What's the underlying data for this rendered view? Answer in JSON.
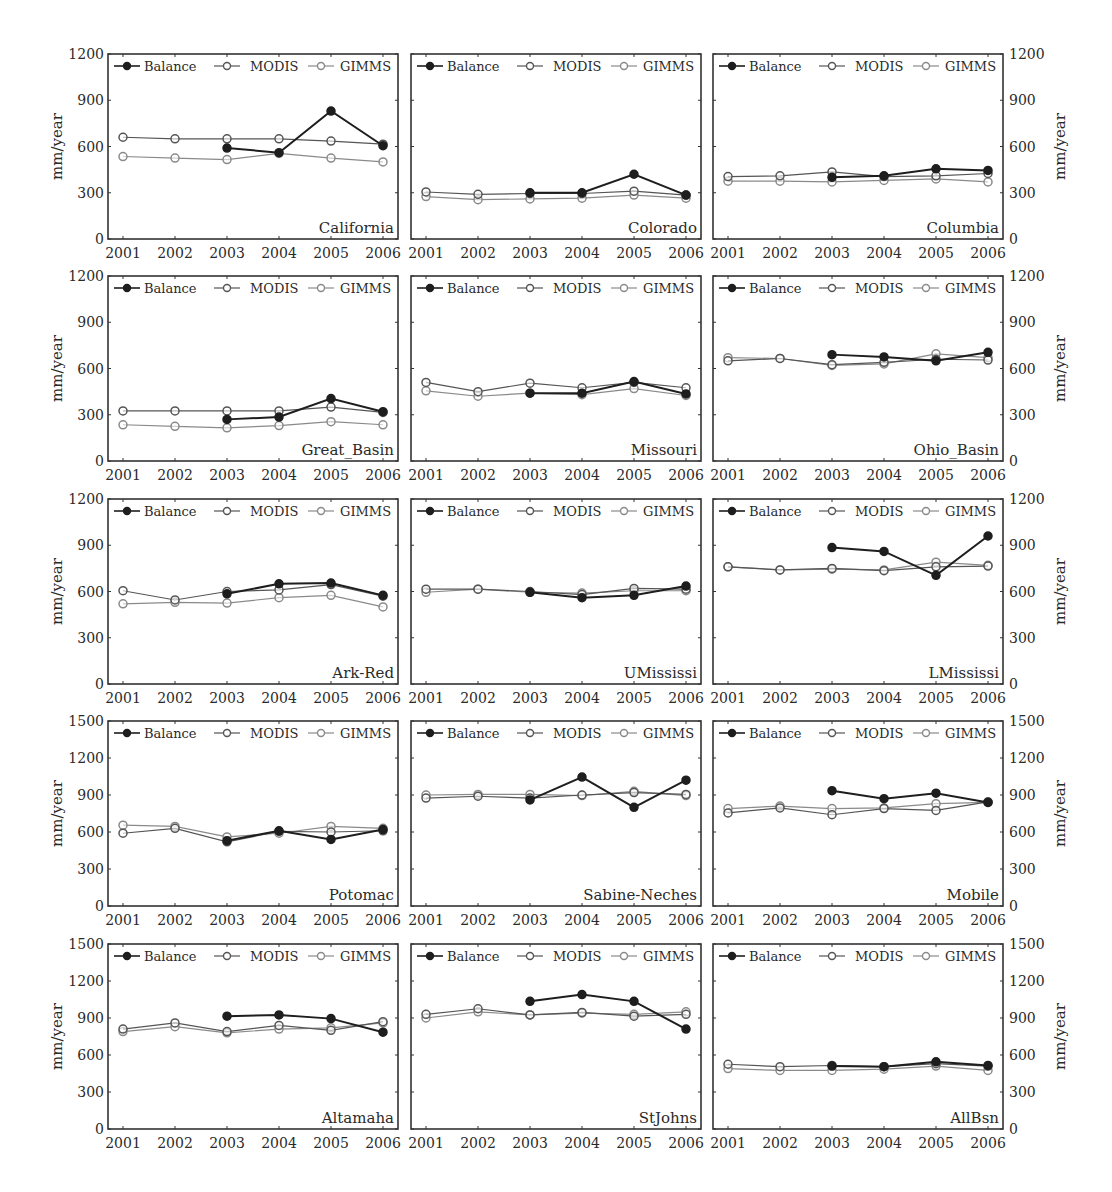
{
  "figure": {
    "ylabel": "mm/year",
    "years": [
      "2001",
      "2002",
      "2003",
      "2004",
      "2005",
      "2006"
    ],
    "legend": [
      "Balance",
      "MODIS",
      "GIMMS"
    ],
    "colors": {
      "Balance": "#1e1e1e",
      "MODIS": "#555555",
      "GIMMS": "#8a8a8a",
      "axis": "#333333"
    }
  },
  "chart_data": [
    {
      "type": "line",
      "title": "California",
      "xlabel": "",
      "ylabel": "mm/year",
      "ylim": [
        0,
        1200
      ],
      "yticks": [
        0,
        300,
        600,
        900,
        1200
      ],
      "axis_side": "left",
      "categories": [
        "2001",
        "2002",
        "2003",
        "2004",
        "2005",
        "2006"
      ],
      "series": [
        {
          "name": "Balance",
          "values": [
            null,
            null,
            590,
            560,
            830,
            605
          ]
        },
        {
          "name": "MODIS",
          "values": [
            660,
            650,
            650,
            650,
            635,
            615
          ]
        },
        {
          "name": "GIMMS",
          "values": [
            535,
            525,
            515,
            555,
            525,
            500
          ]
        }
      ]
    },
    {
      "type": "line",
      "title": "Colorado",
      "xlabel": "",
      "ylabel": "",
      "ylim": [
        0,
        1200
      ],
      "yticks": [
        0,
        300,
        600,
        900,
        1200
      ],
      "axis_side": "none",
      "categories": [
        "2001",
        "2002",
        "2003",
        "2004",
        "2005",
        "2006"
      ],
      "series": [
        {
          "name": "Balance",
          "values": [
            null,
            null,
            300,
            300,
            420,
            285
          ]
        },
        {
          "name": "MODIS",
          "values": [
            305,
            290,
            295,
            295,
            310,
            285
          ]
        },
        {
          "name": "GIMMS",
          "values": [
            275,
            255,
            260,
            265,
            285,
            265
          ]
        }
      ]
    },
    {
      "type": "line",
      "title": "Columbia",
      "xlabel": "",
      "ylabel": "mm/year",
      "ylim": [
        0,
        1200
      ],
      "yticks": [
        0,
        300,
        600,
        900,
        1200
      ],
      "axis_side": "right",
      "categories": [
        "2001",
        "2002",
        "2003",
        "2004",
        "2005",
        "2006"
      ],
      "series": [
        {
          "name": "Balance",
          "values": [
            null,
            null,
            400,
            410,
            455,
            445
          ]
        },
        {
          "name": "MODIS",
          "values": [
            405,
            410,
            435,
            405,
            410,
            425
          ]
        },
        {
          "name": "GIMMS",
          "values": [
            375,
            375,
            370,
            380,
            390,
            370
          ]
        }
      ]
    },
    {
      "type": "line",
      "title": "Great_Basin",
      "xlabel": "",
      "ylabel": "mm/year",
      "ylim": [
        0,
        1200
      ],
      "yticks": [
        0,
        300,
        600,
        900,
        1200
      ],
      "axis_side": "left",
      "categories": [
        "2001",
        "2002",
        "2003",
        "2004",
        "2005",
        "2006"
      ],
      "series": [
        {
          "name": "Balance",
          "values": [
            null,
            null,
            270,
            285,
            405,
            320
          ]
        },
        {
          "name": "MODIS",
          "values": [
            325,
            325,
            325,
            325,
            350,
            315
          ]
        },
        {
          "name": "GIMMS",
          "values": [
            235,
            225,
            215,
            230,
            255,
            235
          ]
        }
      ]
    },
    {
      "type": "line",
      "title": "Missouri",
      "xlabel": "",
      "ylabel": "",
      "ylim": [
        0,
        1200
      ],
      "yticks": [
        0,
        300,
        600,
        900,
        1200
      ],
      "axis_side": "none",
      "categories": [
        "2001",
        "2002",
        "2003",
        "2004",
        "2005",
        "2006"
      ],
      "series": [
        {
          "name": "Balance",
          "values": [
            null,
            null,
            440,
            440,
            515,
            435
          ]
        },
        {
          "name": "MODIS",
          "values": [
            510,
            450,
            505,
            475,
            510,
            475
          ]
        },
        {
          "name": "GIMMS",
          "values": [
            455,
            420,
            440,
            430,
            470,
            425
          ]
        }
      ]
    },
    {
      "type": "line",
      "title": "Ohio_Basin",
      "xlabel": "",
      "ylabel": "mm/year",
      "ylim": [
        0,
        1200
      ],
      "yticks": [
        0,
        300,
        600,
        900,
        1200
      ],
      "axis_side": "right",
      "categories": [
        "2001",
        "2002",
        "2003",
        "2004",
        "2005",
        "2006"
      ],
      "series": [
        {
          "name": "Balance",
          "values": [
            null,
            null,
            690,
            675,
            650,
            705
          ]
        },
        {
          "name": "MODIS",
          "values": [
            650,
            665,
            625,
            640,
            660,
            655
          ]
        },
        {
          "name": "GIMMS",
          "values": [
            670,
            665,
            620,
            630,
            695,
            670
          ]
        }
      ]
    },
    {
      "type": "line",
      "title": "Ark-Red",
      "xlabel": "",
      "ylabel": "mm/year",
      "ylim": [
        0,
        1200
      ],
      "yticks": [
        0,
        300,
        600,
        900,
        1200
      ],
      "axis_side": "left",
      "categories": [
        "2001",
        "2002",
        "2003",
        "2004",
        "2005",
        "2006"
      ],
      "series": [
        {
          "name": "Balance",
          "values": [
            null,
            null,
            585,
            650,
            655,
            575
          ]
        },
        {
          "name": "MODIS",
          "values": [
            605,
            545,
            600,
            610,
            645,
            570
          ]
        },
        {
          "name": "GIMMS",
          "values": [
            520,
            530,
            525,
            560,
            575,
            500
          ]
        }
      ]
    },
    {
      "type": "line",
      "title": "UMississi",
      "xlabel": "",
      "ylabel": "",
      "ylim": [
        0,
        1200
      ],
      "yticks": [
        0,
        300,
        600,
        900,
        1200
      ],
      "axis_side": "none",
      "categories": [
        "2001",
        "2002",
        "2003",
        "2004",
        "2005",
        "2006"
      ],
      "series": [
        {
          "name": "Balance",
          "values": [
            null,
            null,
            595,
            560,
            575,
            635
          ]
        },
        {
          "name": "MODIS",
          "values": [
            615,
            615,
            600,
            580,
            620,
            615
          ]
        },
        {
          "name": "GIMMS",
          "values": [
            595,
            615,
            595,
            590,
            605,
            605
          ]
        }
      ]
    },
    {
      "type": "line",
      "title": "LMississi",
      "xlabel": "",
      "ylabel": "mm/year",
      "ylim": [
        0,
        1200
      ],
      "yticks": [
        0,
        300,
        600,
        900,
        1200
      ],
      "axis_side": "right",
      "categories": [
        "2001",
        "2002",
        "2003",
        "2004",
        "2005",
        "2006"
      ],
      "series": [
        {
          "name": "Balance",
          "values": [
            null,
            null,
            885,
            860,
            705,
            960
          ]
        },
        {
          "name": "MODIS",
          "values": [
            760,
            740,
            750,
            735,
            760,
            765
          ]
        },
        {
          "name": "GIMMS",
          "values": [
            760,
            740,
            745,
            740,
            790,
            770
          ]
        }
      ]
    },
    {
      "type": "line",
      "title": "Potomac",
      "xlabel": "",
      "ylabel": "mm/year",
      "ylim": [
        0,
        1500
      ],
      "yticks": [
        0,
        300,
        600,
        900,
        1200,
        1500
      ],
      "axis_side": "left",
      "categories": [
        "2001",
        "2002",
        "2003",
        "2004",
        "2005",
        "2006"
      ],
      "series": [
        {
          "name": "Balance",
          "values": [
            null,
            null,
            530,
            610,
            540,
            620
          ]
        },
        {
          "name": "MODIS",
          "values": [
            590,
            630,
            520,
            605,
            600,
            610
          ]
        },
        {
          "name": "GIMMS",
          "values": [
            655,
            645,
            560,
            590,
            645,
            630
          ]
        }
      ]
    },
    {
      "type": "line",
      "title": "Sabine-Neches",
      "xlabel": "",
      "ylabel": "",
      "ylim": [
        0,
        1500
      ],
      "yticks": [
        0,
        300,
        600,
        900,
        1200,
        1500
      ],
      "axis_side": "none",
      "categories": [
        "2001",
        "2002",
        "2003",
        "2004",
        "2005",
        "2006"
      ],
      "series": [
        {
          "name": "Balance",
          "values": [
            null,
            null,
            860,
            1045,
            800,
            1020
          ]
        },
        {
          "name": "MODIS",
          "values": [
            875,
            890,
            875,
            900,
            920,
            905
          ]
        },
        {
          "name": "GIMMS",
          "values": [
            900,
            905,
            905,
            895,
            930,
            895
          ]
        }
      ]
    },
    {
      "type": "line",
      "title": "Mobile",
      "xlabel": "",
      "ylabel": "mm/year",
      "ylim": [
        0,
        1500
      ],
      "yticks": [
        0,
        300,
        600,
        900,
        1200,
        1500
      ],
      "axis_side": "right",
      "categories": [
        "2001",
        "2002",
        "2003",
        "2004",
        "2005",
        "2006"
      ],
      "series": [
        {
          "name": "Balance",
          "values": [
            null,
            null,
            935,
            870,
            915,
            840
          ]
        },
        {
          "name": "MODIS",
          "values": [
            755,
            795,
            740,
            790,
            775,
            845
          ]
        },
        {
          "name": "GIMMS",
          "values": [
            790,
            810,
            790,
            795,
            830,
            840
          ]
        }
      ]
    },
    {
      "type": "line",
      "title": "Altamaha",
      "xlabel": "",
      "ylabel": "mm/year",
      "ylim": [
        0,
        1500
      ],
      "yticks": [
        0,
        300,
        600,
        900,
        1200,
        1500
      ],
      "axis_side": "left",
      "categories": [
        "2001",
        "2002",
        "2003",
        "2004",
        "2005",
        "2006"
      ],
      "series": [
        {
          "name": "Balance",
          "values": [
            null,
            null,
            915,
            925,
            895,
            785
          ]
        },
        {
          "name": "MODIS",
          "values": [
            810,
            860,
            790,
            840,
            800,
            870
          ]
        },
        {
          "name": "GIMMS",
          "values": [
            790,
            830,
            780,
            810,
            820,
            860
          ]
        }
      ]
    },
    {
      "type": "line",
      "title": "StJohns",
      "xlabel": "",
      "ylabel": "",
      "ylim": [
        0,
        1500
      ],
      "yticks": [
        0,
        300,
        600,
        900,
        1200,
        1500
      ],
      "axis_side": "none",
      "categories": [
        "2001",
        "2002",
        "2003",
        "2004",
        "2005",
        "2006"
      ],
      "series": [
        {
          "name": "Balance",
          "values": [
            null,
            null,
            1035,
            1090,
            1035,
            810
          ]
        },
        {
          "name": "MODIS",
          "values": [
            930,
            975,
            925,
            945,
            915,
            930
          ]
        },
        {
          "name": "GIMMS",
          "values": [
            900,
            950,
            925,
            940,
            930,
            950
          ]
        }
      ]
    },
    {
      "type": "line",
      "title": "AllBsn",
      "xlabel": "",
      "ylabel": "mm/year",
      "ylim": [
        0,
        1500
      ],
      "yticks": [
        0,
        300,
        600,
        900,
        1200,
        1500
      ],
      "axis_side": "right",
      "categories": [
        "2001",
        "2002",
        "2003",
        "2004",
        "2005",
        "2006"
      ],
      "series": [
        {
          "name": "Balance",
          "values": [
            null,
            null,
            510,
            505,
            545,
            515
          ]
        },
        {
          "name": "MODIS",
          "values": [
            525,
            505,
            515,
            505,
            530,
            510
          ]
        },
        {
          "name": "GIMMS",
          "values": [
            490,
            475,
            475,
            485,
            510,
            475
          ]
        }
      ]
    }
  ]
}
